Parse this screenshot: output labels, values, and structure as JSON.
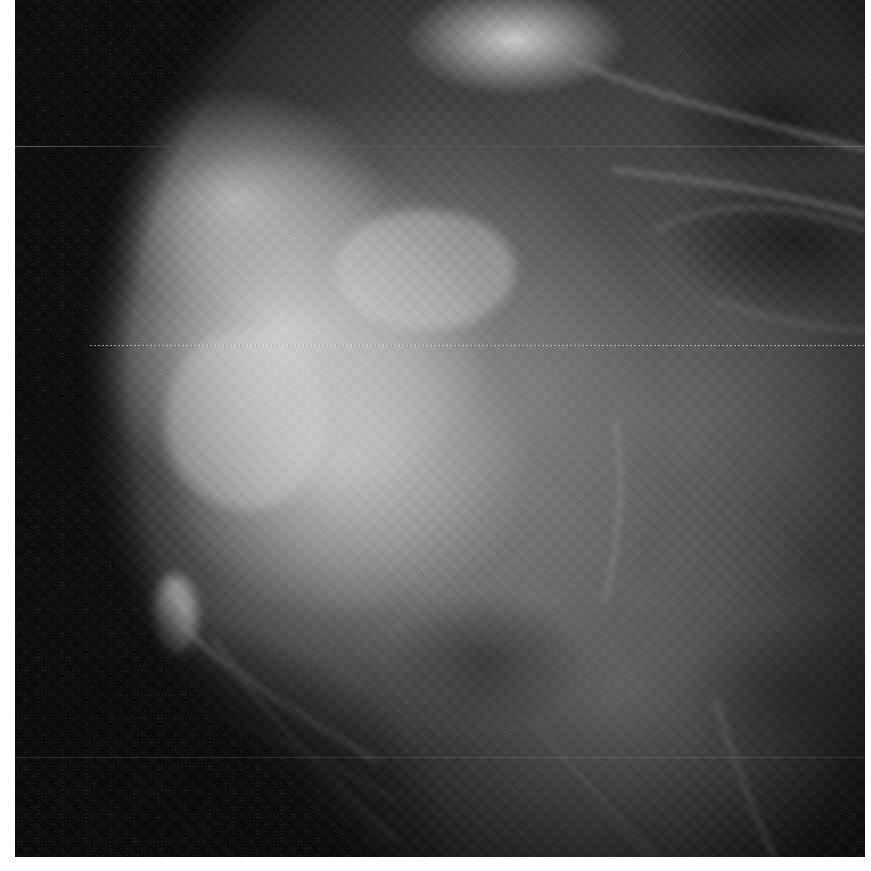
{
  "image": {
    "kind": "grayscale radiograph",
    "frame": {
      "x": 15,
      "y": 0,
      "width": 850,
      "height": 857
    },
    "background_color": "#ffffff",
    "palette": {
      "dark": "#050505",
      "mid": "#6e6e6e",
      "light": "#d7d7d7"
    }
  }
}
